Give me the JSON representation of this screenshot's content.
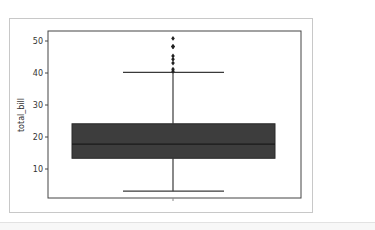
{
  "chart_data": {
    "type": "box",
    "title": "",
    "xlabel": "",
    "ylabel": "total_bill",
    "ylim": [
      0.5,
      52.5
    ],
    "yticks": [
      10,
      20,
      30,
      40,
      50
    ],
    "grid": false,
    "legend": null,
    "series": [
      {
        "name": "total_bill",
        "whisker_low": 3.07,
        "q1": 13.35,
        "median": 17.8,
        "q3": 24.13,
        "whisker_high": 40.17,
        "outliers": [
          40.55,
          41.19,
          43.11,
          44.3,
          45.35,
          48.17,
          48.27,
          48.33,
          50.81
        ],
        "box_color": "#3d3d3d",
        "median_color": "#1a1a1a"
      }
    ]
  },
  "labels": {
    "ylabel": "total_bill",
    "yticks": [
      "10",
      "20",
      "30",
      "40",
      "50"
    ]
  }
}
